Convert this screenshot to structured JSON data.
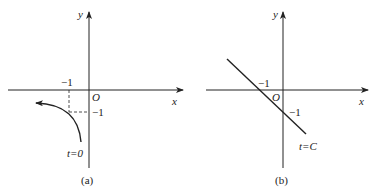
{
  "panels": [
    {
      "id": "a",
      "caption": "(a)",
      "axis_x_label": "x",
      "axis_y_label": "y",
      "origin_label": "O",
      "x_tick_label": "−1",
      "y_tick_label": "−1",
      "curve_label": "t=0",
      "curve_type": "arc with arrow pointing left",
      "color": "#222222"
    },
    {
      "id": "b",
      "caption": "(b)",
      "axis_x_label": "x",
      "axis_y_label": "y",
      "origin_label": "O",
      "x_tick_label": "−1",
      "y_tick_label": "−1",
      "curve_label": "t=C",
      "curve_type": "straight line through (−1,0) and (0,−1)",
      "color": "#222222"
    }
  ]
}
